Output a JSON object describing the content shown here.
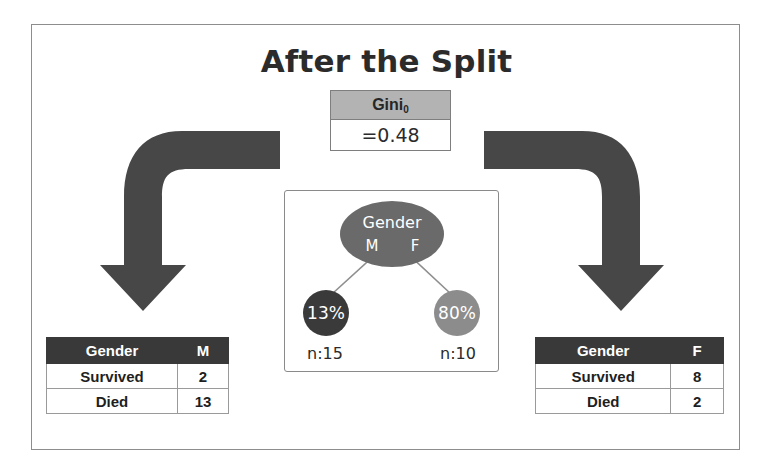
{
  "slide": {
    "title": "After the Split"
  },
  "gini": {
    "label": "Gini",
    "subscript": "0",
    "value": "=0.48"
  },
  "tree": {
    "root": {
      "label": "Gender",
      "left_branch": "M",
      "right_branch": "F"
    },
    "leaves": [
      {
        "percent": "13%",
        "n": "n:15",
        "color": "#3a3a3a"
      },
      {
        "percent": "80%",
        "n": "n:10",
        "color": "#8c8c8c"
      }
    ]
  },
  "tables": [
    {
      "name": "male",
      "headers": [
        "Gender",
        "M"
      ],
      "rows": [
        {
          "label": "Survived",
          "value": "2"
        },
        {
          "label": "Died",
          "value": "13"
        }
      ]
    },
    {
      "name": "female",
      "headers": [
        "Gender",
        "F"
      ],
      "rows": [
        {
          "label": "Survived",
          "value": "8"
        },
        {
          "label": "Died",
          "value": "2"
        }
      ]
    }
  ],
  "arrows": [
    {
      "name": "arrow-to-male-table",
      "direction": "down-left",
      "color": "#474747"
    },
    {
      "name": "arrow-to-female-table",
      "direction": "down-right",
      "color": "#474747"
    }
  ],
  "colors": {
    "frame_border": "#8d8d8d",
    "gini_header_bg": "#b3b3b3",
    "table_header_bg": "#393939",
    "root_node": "#6a6a6a",
    "arrow": "#474747"
  }
}
